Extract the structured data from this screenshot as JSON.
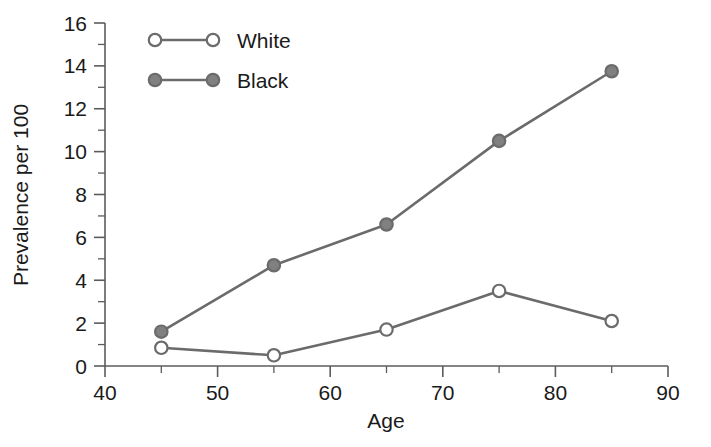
{
  "chart_data": {
    "type": "line",
    "title": "",
    "xlabel": "Age",
    "ylabel": "Prevalence per 100",
    "x": [
      45,
      55,
      65,
      75,
      85
    ],
    "xlim": [
      40,
      90
    ],
    "ylim": [
      0,
      16
    ],
    "x_ticks_major": [
      40,
      50,
      60,
      70,
      80,
      90
    ],
    "x_ticks_minor": [
      45,
      55,
      65,
      75,
      85
    ],
    "x_tick_labels": [
      "40",
      "50",
      "60",
      "70",
      "80",
      "90"
    ],
    "y_ticks_major": [
      0,
      2,
      4,
      6,
      8,
      10,
      12,
      14,
      16
    ],
    "y_ticks_minor": [
      1,
      3,
      5,
      7,
      9,
      11,
      13,
      15
    ],
    "y_tick_labels": [
      "0",
      "2",
      "4",
      "6",
      "8",
      "10",
      "12",
      "14",
      "16"
    ],
    "grid": false,
    "legend_position": "top-left",
    "series": [
      {
        "name": "White",
        "marker": "open-circle",
        "color": "#6b6b6b",
        "marker_fill": "#ffffff",
        "values": [
          0.85,
          0.5,
          1.7,
          3.5,
          2.1
        ]
      },
      {
        "name": "Black",
        "marker": "filled-circle",
        "color": "#6b6b6b",
        "marker_fill": "#808080",
        "values": [
          1.6,
          4.7,
          6.6,
          10.5,
          13.75
        ]
      }
    ]
  },
  "legend": {
    "entries": [
      {
        "label": "White"
      },
      {
        "label": "Black"
      }
    ]
  },
  "colors": {
    "line": "#6b6b6b",
    "axis": "#5c5c5c",
    "text": "#1a1a1a",
    "background": "#ffffff"
  }
}
